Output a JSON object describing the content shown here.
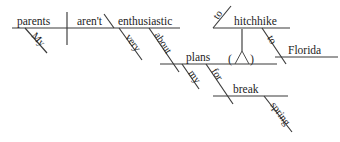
{
  "diagram": {
    "type": "reed-kellogg-sentence-diagram",
    "sentence": "My parents aren't very enthusiastic about my plans to hitchhike to Florida for spring break.",
    "ink_color": "#3a3a3a",
    "background_color": "#ffffff",
    "words": {
      "subject": "parents",
      "subject_modifier": "My",
      "verb": "aren't",
      "predicate_adjective": "enthusiastic",
      "adjective_modifier": "very",
      "preposition_about": "about",
      "object_of_about": "plans",
      "plans_modifier": "my",
      "infinitive_to_1": "to",
      "infinitive_verb": "hitchhike",
      "preposition_to_2": "to",
      "object_of_to": "Florida",
      "preposition_for": "for",
      "object_of_for": "break",
      "break_modifier": "spring",
      "implied_open_paren": "(",
      "implied_marker": "∧",
      "implied_close_paren": ")"
    }
  }
}
